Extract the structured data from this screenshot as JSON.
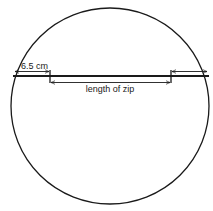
{
  "diagram": {
    "shape": "circle",
    "labels": {
      "seam_allowance": "6.5 cm",
      "zip_length": "length of zip"
    },
    "colors": {
      "stroke": "#1a1a1a",
      "background": "#ffffff"
    }
  }
}
